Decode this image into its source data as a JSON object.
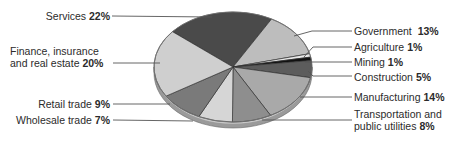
{
  "chart_data": {
    "type": "pie",
    "title": "",
    "style": "3d-elliptical-pie-grayscale",
    "legend": "none (leader-line labels)",
    "unit": "%",
    "slices": [
      {
        "label": "Services",
        "value": 22,
        "color": "#4a4a4a",
        "label_side": "left"
      },
      {
        "label": "Government",
        "value": 13,
        "color": "#bdbdbd",
        "label_side": "right"
      },
      {
        "label": "Agriculture",
        "value": 1,
        "color": "#e8e8e8",
        "label_side": "right"
      },
      {
        "label": "Mining",
        "value": 1,
        "color": "#111111",
        "label_side": "right"
      },
      {
        "label": "Construction",
        "value": 5,
        "color": "#5c5c5c",
        "label_side": "right"
      },
      {
        "label": "Manufacturing",
        "value": 14,
        "color": "#a9a9a9",
        "label_side": "right"
      },
      {
        "label": "Transportation and public utilities",
        "value": 8,
        "color": "#8e8e8e",
        "label_side": "right"
      },
      {
        "label": "Wholesale trade",
        "value": 7,
        "color": "#d6d6d6",
        "label_side": "left"
      },
      {
        "label": "Retail trade",
        "value": 9,
        "color": "#7a7a7a",
        "label_side": "left"
      },
      {
        "label": "Finance, insurance and real estate",
        "value": 20,
        "color": "#cfcfcf",
        "label_side": "left"
      }
    ]
  },
  "labels": {
    "services": {
      "name": "Services",
      "pct": "22%"
    },
    "finance": {
      "line1": "Finance, insurance",
      "name": "and real estate",
      "pct": "20%"
    },
    "retail": {
      "name": "Retail trade",
      "pct": "9%"
    },
    "wholesale": {
      "name": "Wholesale trade",
      "pct": "7%"
    },
    "government": {
      "name": "Government",
      "pct": "13%"
    },
    "agriculture": {
      "name": "Agriculture",
      "pct": "1%"
    },
    "mining": {
      "name": "Mining",
      "pct": "1%"
    },
    "construction": {
      "name": "Construction",
      "pct": "5%"
    },
    "manufacturing": {
      "name": "Manufacturing",
      "pct": "14%"
    },
    "transportation": {
      "line1": "Transportation and",
      "name": "public utilities",
      "pct": "8%"
    }
  }
}
